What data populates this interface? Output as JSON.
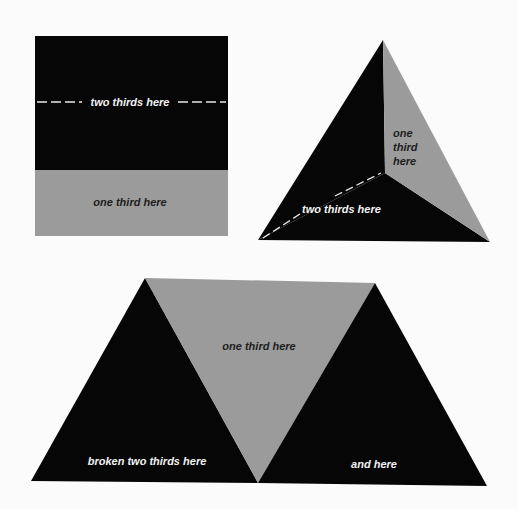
{
  "colors": {
    "background": "#fbfbfb",
    "dark": "#060606",
    "gray": "#9b9b9b",
    "dash": "#e8e8e8"
  },
  "square": {
    "top_label": "two thirds here",
    "bottom_label": "one third here"
  },
  "triangle": {
    "right_label_lines": [
      "one",
      "third",
      "here"
    ],
    "bottom_label": "two thirds here"
  },
  "trapezoid": {
    "center_label": "one third here",
    "left_label": "broken two thirds here",
    "right_label": "and here"
  }
}
